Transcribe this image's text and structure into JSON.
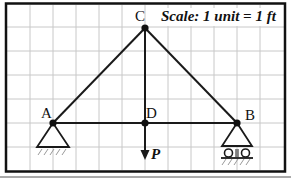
{
  "diagram": {
    "type": "truss",
    "scale_note": "Scale: 1 unit = 1 ft",
    "grid": {
      "cell_px_x": 23,
      "cell_px_y": 24,
      "color": "#c8c8c8"
    },
    "nodes": [
      {
        "id": "A",
        "label": "A",
        "x": 0,
        "y": 0,
        "support": "pin"
      },
      {
        "id": "D",
        "label": "D",
        "x": 4,
        "y": 0,
        "support": "none"
      },
      {
        "id": "B",
        "label": "B",
        "x": 8,
        "y": 0,
        "support": "roller"
      },
      {
        "id": "C",
        "label": "C",
        "x": 4,
        "y": 4,
        "support": "none"
      }
    ],
    "members": [
      [
        "A",
        "C"
      ],
      [
        "C",
        "B"
      ],
      [
        "A",
        "D"
      ],
      [
        "D",
        "B"
      ],
      [
        "C",
        "D"
      ]
    ],
    "loads": [
      {
        "node": "D",
        "label": "P",
        "direction": "down"
      }
    ],
    "colors": {
      "frame": "#111111",
      "member": "#1a1a1a",
      "grid": "#c8c8c8",
      "hatch": "#9a9a9a"
    }
  }
}
